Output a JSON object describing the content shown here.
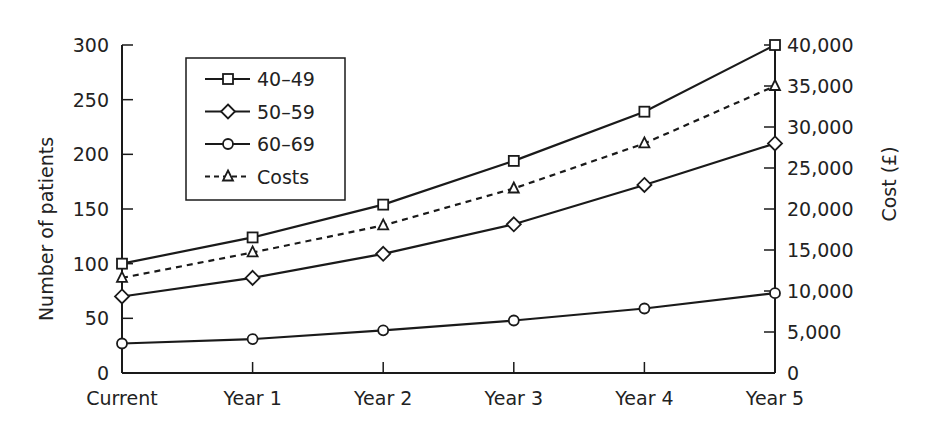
{
  "chart_data": {
    "type": "line",
    "title": "",
    "categories": [
      "Current",
      "Year 1",
      "Year 2",
      "Year 3",
      "Year 4",
      "Year 5"
    ],
    "xlabel": "",
    "ylabel": "Number of patients",
    "y2label": "Cost (£)",
    "ylim": [
      0,
      300
    ],
    "y2lim": [
      0,
      40000
    ],
    "yticks": [
      0,
      50,
      100,
      150,
      200,
      250,
      300
    ],
    "y2ticks": [
      0,
      5000,
      10000,
      15000,
      20000,
      25000,
      30000,
      35000,
      40000
    ],
    "ytick_labels": [
      "0",
      "50",
      "100",
      "150",
      "200",
      "250",
      "300"
    ],
    "y2tick_labels": [
      "0",
      "5,000",
      "10,000",
      "15,000",
      "20,000",
      "25,000",
      "30,000",
      "35,000",
      "40,000"
    ],
    "grid": false,
    "legend_position": "upper-left-inside",
    "series": [
      {
        "name": "40–49",
        "axis": "left",
        "marker": "square",
        "line": "solid",
        "values": [
          100,
          124,
          154,
          194,
          239,
          300
        ]
      },
      {
        "name": "50–59",
        "axis": "left",
        "marker": "diamond",
        "line": "solid",
        "values": [
          70,
          87,
          109,
          136,
          172,
          210
        ]
      },
      {
        "name": "60–69",
        "axis": "left",
        "marker": "circle",
        "line": "solid",
        "values": [
          27,
          31,
          39,
          48,
          59,
          73
        ]
      },
      {
        "name": "Costs",
        "axis": "right",
        "marker": "triangle",
        "line": "dashed",
        "values": [
          11600,
          14700,
          18000,
          22500,
          28000,
          35000
        ]
      }
    ]
  }
}
